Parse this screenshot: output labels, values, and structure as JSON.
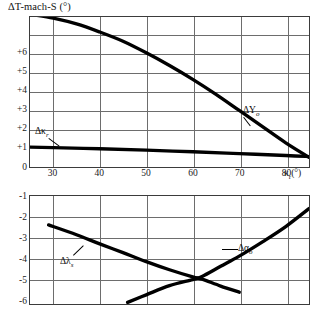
{
  "chart_data": {
    "type": "line",
    "title": "ΔT-mach-S (°)",
    "xlabel": "κᵣ(°)",
    "ylabel": "",
    "grid": true,
    "legend": "inline-annotations",
    "xlim": [
      25,
      85
    ],
    "x_ticks": [
      30,
      40,
      50,
      60,
      70,
      80
    ],
    "panels": [
      {
        "name": "upper",
        "ylim": [
          0,
          6.5
        ],
        "y_ticks": [
          "0",
          "+1",
          "+2",
          "+3",
          "+4",
          "+5",
          "+6"
        ],
        "series": [
          {
            "name": "ΔYₒ",
            "label": "ΔY",
            "label_sub": "o",
            "x": [
              25,
              30,
              35,
              40,
              45,
              50,
              55,
              60,
              65,
              70,
              75,
              80,
              85
            ],
            "y": [
              6.62,
              6.45,
              6.2,
              5.85,
              5.45,
              4.95,
              4.4,
              3.8,
              3.15,
              2.45,
              1.75,
              1.05,
              0.42
            ]
          },
          {
            "name": "Δκᵣ",
            "label": "Δκ",
            "label_sub": "r",
            "x": [
              25,
              30,
              40,
              50,
              60,
              70,
              80,
              85
            ],
            "y": [
              0.86,
              0.84,
              0.79,
              0.73,
              0.66,
              0.58,
              0.5,
              0.45
            ]
          }
        ]
      },
      {
        "name": "lower",
        "ylim": [
          -6.3,
          -1.0
        ],
        "y_ticks": [
          "-1",
          "-2",
          "-3",
          "-4",
          "-5",
          "-6"
        ],
        "series": [
          {
            "name": "Δλₛ",
            "label": "Δλ",
            "label_sub": "s",
            "x": [
              29,
              35,
              40,
              45,
              50,
              55,
              60,
              62,
              66,
              70
            ],
            "y": [
              -2.42,
              -2.9,
              -3.35,
              -3.78,
              -4.22,
              -4.62,
              -4.97,
              -5.08,
              -5.42,
              -5.72
            ]
          },
          {
            "name": "Δαₒ",
            "label": "Δα",
            "label_sub": "o",
            "x": [
              46,
              50,
              55,
              60,
              62,
              66,
              70,
              75,
              80,
              85
            ],
            "y": [
              -6.22,
              -5.85,
              -5.4,
              -5.1,
              -4.95,
              -4.45,
              -3.95,
              -3.25,
              -2.5,
              -1.62
            ]
          }
        ]
      }
    ],
    "annotations": [
      {
        "text": "ΔYₒ",
        "panel": "upper",
        "x": 63,
        "y": 2.0
      },
      {
        "text": "Δκᵣ",
        "panel": "upper",
        "x": 31,
        "y": 1.55
      },
      {
        "text": "Δλₛ",
        "panel": "lower",
        "x": 40,
        "y": -4.55
      },
      {
        "text": "Δαₒ",
        "panel": "lower",
        "x": 66,
        "y": -3.9
      }
    ]
  },
  "title": {
    "prefix": "ΔT-mach-S (",
    "degree": "°",
    "suffix": ")",
    "full": "ΔT-mach-S (°)"
  },
  "axes": {
    "x_label_base": "κ",
    "x_label_sub": "r",
    "x_label_unit": "(°)",
    "x_ticks": [
      "30",
      "40",
      "50",
      "60",
      "70",
      "80"
    ],
    "y_ticks_top": [
      "+6",
      "+5",
      "+4",
      "+3",
      "+2",
      "+1",
      "0"
    ],
    "y_ticks_bottom": [
      "-1",
      "-2",
      "-3",
      "-4",
      "-5",
      "-6"
    ]
  },
  "labels": {
    "delta_y": {
      "base": "ΔY",
      "sub": "o"
    },
    "delta_kappa": {
      "base": "Δκ",
      "sub": "r"
    },
    "delta_lambda": {
      "base": "Δλ",
      "sub": "s"
    },
    "delta_alpha": {
      "base": "Δα",
      "sub": "o"
    }
  },
  "colors": {
    "curve": "#000000",
    "frame": "#3b3b3b",
    "grid": "#6d6d6d",
    "text": "#111111",
    "background": "#ffffff"
  }
}
